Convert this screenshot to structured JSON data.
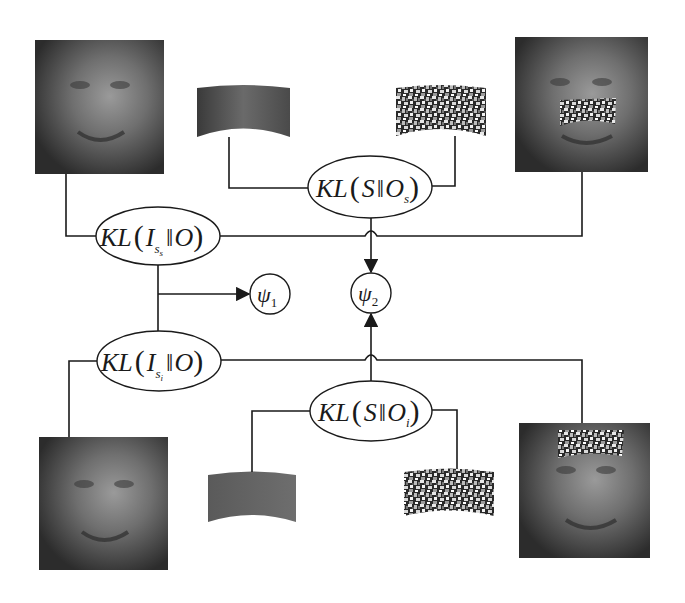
{
  "diagram": {
    "type": "kl-divergence-occlusion-diagram",
    "colors": {
      "line": "#1a1a1a",
      "background": "#ffffff",
      "face_dark": "#2a2a2a",
      "face_light": "#8a8a8a"
    },
    "images": [
      {
        "id": "face-top-left",
        "desc": "clean face image (source)",
        "x": 35,
        "y": 40,
        "w": 129,
        "h": 134,
        "occlusion": "none"
      },
      {
        "id": "face-top-right",
        "desc": "face with noise occlusion over nose/mouth",
        "x": 515,
        "y": 37,
        "w": 133,
        "h": 135,
        "occlusion": "nose"
      },
      {
        "id": "face-bottom-left",
        "desc": "clean face image (source)",
        "x": 39,
        "y": 437,
        "w": 129,
        "h": 133,
        "occlusion": "none"
      },
      {
        "id": "face-bottom-right",
        "desc": "face with noise occlusion over forehead",
        "x": 519,
        "y": 423,
        "w": 131,
        "h": 135,
        "occlusion": "forehead"
      }
    ],
    "patches": [
      {
        "id": "patch-top-clean",
        "desc": "curved clean nose-region patch",
        "x": 197,
        "y": 85,
        "w": 93,
        "h": 52,
        "kind": "clean"
      },
      {
        "id": "patch-top-noise",
        "desc": "curved noise patch",
        "x": 396,
        "y": 85,
        "w": 90,
        "h": 51,
        "kind": "noise"
      },
      {
        "id": "patch-bottom-clean",
        "desc": "curved clean forehead patch",
        "x": 208,
        "y": 472,
        "w": 88,
        "h": 50,
        "kind": "clean"
      },
      {
        "id": "patch-bottom-noise",
        "desc": "curved noise patch",
        "x": 404,
        "y": 469,
        "w": 90,
        "h": 47,
        "kind": "noise"
      }
    ],
    "nodes": [
      {
        "id": "kl-s-os",
        "shape": "ellipse",
        "cx": 370,
        "cy": 187,
        "rx": 62,
        "ry": 31,
        "main": "KL(S‖O",
        "sub": "s",
        "close": ")"
      },
      {
        "id": "kl-iss-o",
        "shape": "ellipse",
        "cx": 158,
        "cy": 236,
        "rx": 62,
        "ry": 29,
        "main_pre": "KL(I",
        "sub": "s",
        "subsub": "s",
        "main_post": "‖O)"
      },
      {
        "id": "kl-isi-o",
        "shape": "ellipse",
        "cx": 159,
        "cy": 361,
        "rx": 62,
        "ry": 30,
        "main_pre": "KL(I",
        "sub": "s",
        "subsub": "i",
        "main_post": "‖O)"
      },
      {
        "id": "kl-s-oi",
        "shape": "ellipse",
        "cx": 371,
        "cy": 411,
        "rx": 61,
        "ry": 30,
        "main": "KL(S‖O",
        "sub": "i",
        "close": ")"
      },
      {
        "id": "psi-1",
        "shape": "circle",
        "cx": 270,
        "cy": 294,
        "r": 20,
        "label": "ψ",
        "sub": "1"
      },
      {
        "id": "psi-2",
        "shape": "circle",
        "cx": 371,
        "cy": 293,
        "r": 20,
        "label": "ψ",
        "sub": "2"
      }
    ],
    "labels": {
      "kl_s_os": {
        "text": "KL",
        "paren_open": "(",
        "S": "S",
        "norm": "‖",
        "O": "O",
        "sub": "s",
        "paren_close": ")"
      },
      "kl_iss_o": {
        "text": "KL",
        "paren_open": "(",
        "I": "I",
        "sub": "s",
        "subsub": "s",
        "norm": "‖",
        "O": "O",
        "paren_close": ")"
      },
      "kl_isi_o": {
        "text": "KL",
        "paren_open": "(",
        "I": "I",
        "sub": "s",
        "subsub": "i",
        "norm": "‖",
        "O": "O",
        "paren_close": ")"
      },
      "kl_s_oi": {
        "text": "KL",
        "paren_open": "(",
        "S": "S",
        "norm": "‖",
        "O": "O",
        "sub": "i",
        "paren_close": ")"
      },
      "psi1": {
        "sym": "ψ",
        "sub": "1"
      },
      "psi2": {
        "sym": "ψ",
        "sub": "2"
      }
    },
    "edges": [
      {
        "from": "patch-top-clean",
        "to": "kl-s-os"
      },
      {
        "from": "patch-top-noise",
        "to": "kl-s-os"
      },
      {
        "from": "face-top-left",
        "to": "kl-iss-o"
      },
      {
        "from": "face-top-right",
        "to": "kl-iss-o"
      },
      {
        "from": "kl-s-os",
        "to": "psi-2",
        "arrow": true
      },
      {
        "from": "kl-iss-o",
        "to": "psi-1",
        "arrow": true,
        "via": "junction"
      },
      {
        "from": "kl-isi-o",
        "to": "psi-1",
        "arrow": true,
        "via": "junction"
      },
      {
        "from": "face-bottom-left",
        "to": "kl-isi-o"
      },
      {
        "from": "face-bottom-right",
        "to": "kl-isi-o"
      },
      {
        "from": "kl-s-oi",
        "to": "psi-2",
        "arrow": true
      },
      {
        "from": "patch-bottom-clean",
        "to": "kl-s-oi"
      },
      {
        "from": "patch-bottom-noise",
        "to": "kl-s-oi"
      }
    ]
  }
}
